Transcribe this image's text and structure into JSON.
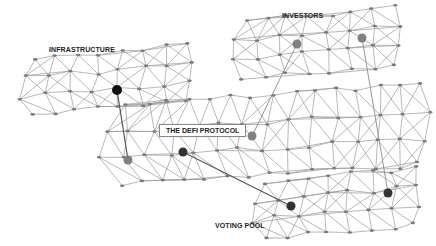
{
  "diagram": {
    "labels": {
      "infrastructure": "INFRASTRUCTURE",
      "investors": "INVESTORS",
      "defi_protocol": "THE DEFI PROTOCOL",
      "voting_pool": "VOTING POOL"
    },
    "colors": {
      "mesh_line": "#9a9a9a",
      "mesh_node": "#7a7a7a",
      "hub_black": "#111111",
      "hub_dark": "#333333",
      "hub_gray": "#808080",
      "connector": "#555555"
    },
    "clusters": [
      {
        "id": "infrastructure",
        "bbox": [
          18,
          52,
          192,
          108
        ]
      },
      {
        "id": "investors",
        "bbox": [
          228,
          15,
          400,
          72
        ]
      },
      {
        "id": "defi_protocol",
        "bbox": [
          93,
          95,
          430,
          175
        ]
      },
      {
        "id": "voting_pool",
        "bbox": [
          250,
          175,
          420,
          232
        ]
      }
    ],
    "hubs": [
      {
        "cluster": "infrastructure",
        "x": 117,
        "y": 90,
        "color": "black"
      },
      {
        "cluster": "investors",
        "x": 297,
        "y": 44,
        "color": "gray"
      },
      {
        "cluster": "investors",
        "x": 362,
        "y": 38,
        "color": "gray"
      },
      {
        "cluster": "defi_protocol",
        "x": 128,
        "y": 160,
        "color": "gray"
      },
      {
        "cluster": "defi_protocol",
        "x": 183,
        "y": 152,
        "color": "dark"
      },
      {
        "cluster": "defi_protocol",
        "x": 252,
        "y": 136,
        "color": "gray"
      },
      {
        "cluster": "voting_pool",
        "x": 291,
        "y": 206,
        "color": "dark"
      },
      {
        "cluster": "voting_pool",
        "x": 388,
        "y": 193,
        "color": "dark"
      }
    ],
    "connections": [
      {
        "from": "infrastructure",
        "to": "defi_protocol",
        "x1": 117,
        "y1": 90,
        "x2": 128,
        "y2": 160
      },
      {
        "from": "investors",
        "to": "defi_protocol",
        "x1": 297,
        "y1": 44,
        "x2": 252,
        "y2": 136
      },
      {
        "from": "investors",
        "to": "voting_pool",
        "x1": 362,
        "y1": 38,
        "x2": 388,
        "y2": 193
      },
      {
        "from": "defi_protocol",
        "to": "voting_pool",
        "x1": 183,
        "y1": 152,
        "x2": 291,
        "y2": 206
      }
    ]
  }
}
